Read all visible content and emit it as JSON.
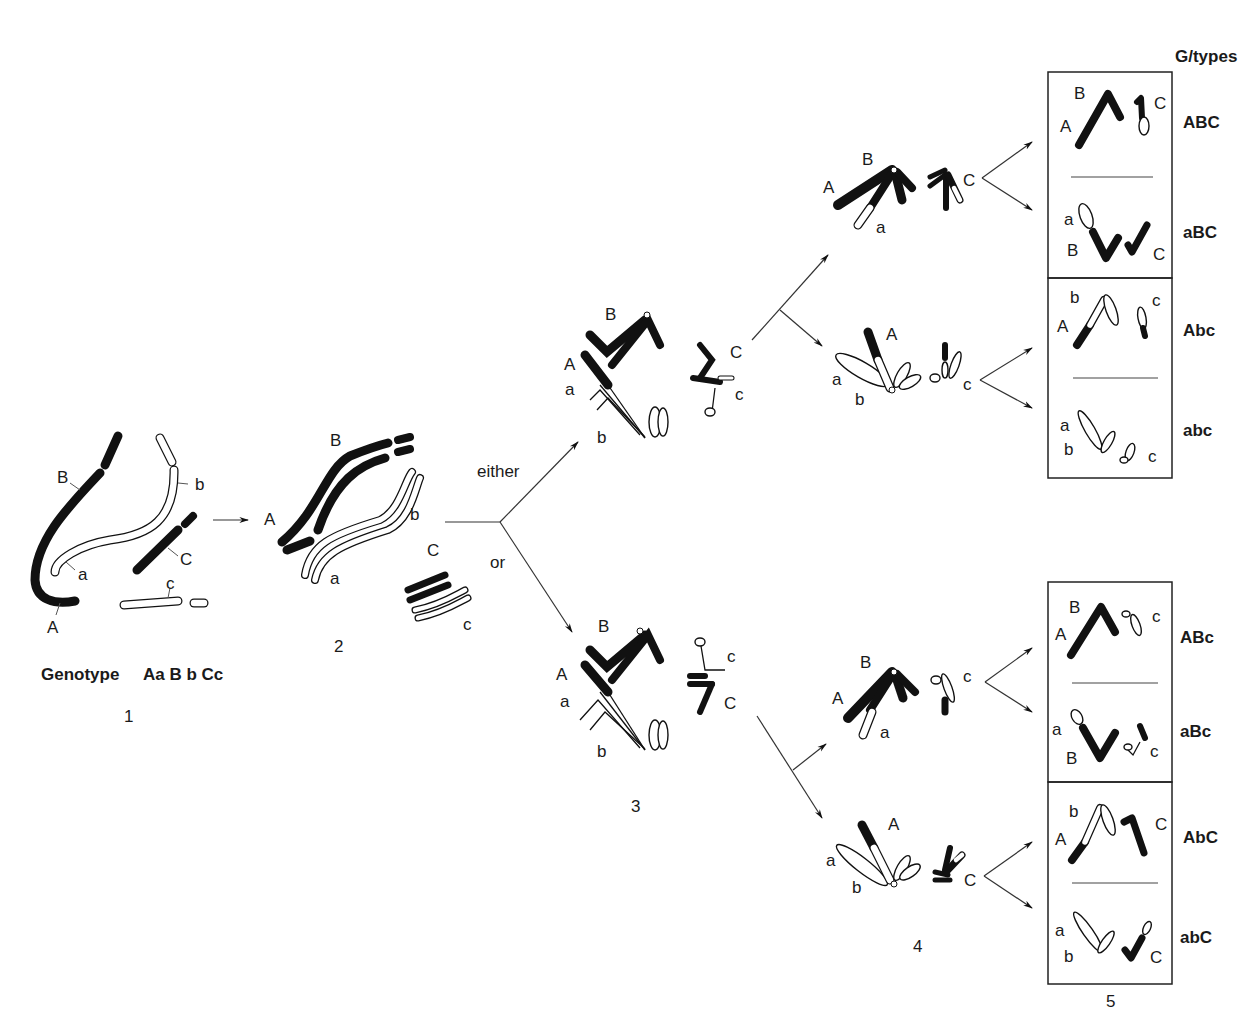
{
  "figure": {
    "header_label": "G/types",
    "branch_labels": {
      "either": "either",
      "or": "or"
    },
    "stage_numbers": [
      "1",
      "2",
      "3",
      "4",
      "5"
    ],
    "genotype": {
      "prefix": "Genotype",
      "value": "AaBbCc",
      "display": "Aa B b Cc"
    },
    "stage1_labels": [
      "B",
      "b",
      "a",
      "C",
      "c",
      "A"
    ],
    "stage2_labels": [
      "B",
      "A",
      "b",
      "a",
      "C",
      "c"
    ],
    "stage3_upper_labels": [
      "B",
      "A",
      "a",
      "b",
      "C",
      "c"
    ],
    "stage3_lower_labels": [
      "B",
      "A",
      "a",
      "b",
      "c",
      "C"
    ],
    "stage4": [
      {
        "labels": [
          "B",
          "A",
          "a",
          "C"
        ]
      },
      {
        "labels": [
          "A",
          "a",
          "b",
          "c"
        ]
      },
      {
        "labels": [
          "B",
          "A",
          "a",
          "c"
        ]
      },
      {
        "labels": [
          "A",
          "a",
          "b",
          "C"
        ]
      }
    ],
    "gamete_boxes": [
      {
        "gametes": [
          {
            "genotype": "ABC",
            "labels": [
              "B",
              "A",
              "C"
            ]
          },
          {
            "genotype": "aBC",
            "labels": [
              "a",
              "B",
              "C"
            ]
          }
        ]
      },
      {
        "gametes": [
          {
            "genotype": "Abc",
            "labels": [
              "b",
              "A",
              "c"
            ]
          },
          {
            "genotype": "abc",
            "labels": [
              "a",
              "b",
              "c"
            ]
          }
        ]
      },
      {
        "gametes": [
          {
            "genotype": "ABc",
            "labels": [
              "B",
              "A",
              "c"
            ]
          },
          {
            "genotype": "aBc",
            "labels": [
              "a",
              "B",
              "c"
            ]
          }
        ]
      },
      {
        "gametes": [
          {
            "genotype": "AbC",
            "labels": [
              "b",
              "A",
              "C"
            ]
          },
          {
            "genotype": "abC",
            "labels": [
              "a",
              "b",
              "C"
            ]
          }
        ]
      }
    ],
    "colors": {
      "dark_chromatid": "#111111",
      "light_chromatid": "#ffffff",
      "line": "#333333"
    }
  }
}
